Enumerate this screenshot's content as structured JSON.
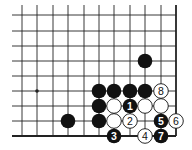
{
  "diagram": {
    "type": "go-problem",
    "grid": {
      "columns_x": [
        22,
        37,
        53,
        68,
        84,
        99,
        114,
        130,
        145,
        161,
        176
      ],
      "rows_y": [
        15,
        31,
        46,
        61,
        76,
        91,
        106,
        121,
        136
      ],
      "left_extent": 12,
      "top_extent": 5,
      "right_edge": true,
      "bottom_edge": true
    },
    "star_points": [
      {
        "col": 1,
        "row": 5
      }
    ],
    "stones": [
      {
        "col": 8,
        "row": 3,
        "color": "black",
        "label": ""
      },
      {
        "col": 5,
        "row": 5,
        "color": "black",
        "label": ""
      },
      {
        "col": 6,
        "row": 5,
        "color": "black",
        "label": ""
      },
      {
        "col": 7,
        "row": 5,
        "color": "black",
        "label": ""
      },
      {
        "col": 8,
        "row": 5,
        "color": "black",
        "label": ""
      },
      {
        "col": 9,
        "row": 5,
        "color": "white",
        "label": "8"
      },
      {
        "col": 5,
        "row": 6,
        "color": "black",
        "label": ""
      },
      {
        "col": 6,
        "row": 6,
        "color": "white",
        "label": ""
      },
      {
        "col": 7,
        "row": 6,
        "color": "black",
        "label": "1"
      },
      {
        "col": 8,
        "row": 6,
        "color": "white",
        "label": ""
      },
      {
        "col": 9,
        "row": 6,
        "color": "white",
        "label": ""
      },
      {
        "col": 3,
        "row": 7,
        "color": "black",
        "label": ""
      },
      {
        "col": 5,
        "row": 7,
        "color": "black",
        "label": ""
      },
      {
        "col": 6,
        "row": 7,
        "color": "white",
        "label": ""
      },
      {
        "col": 7,
        "row": 7,
        "color": "white",
        "label": "2"
      },
      {
        "col": 9,
        "row": 7,
        "color": "black",
        "label": "5"
      },
      {
        "col": 10,
        "row": 7,
        "color": "white",
        "label": "6"
      },
      {
        "col": 6,
        "row": 8,
        "color": "black",
        "label": "3"
      },
      {
        "col": 8,
        "row": 8,
        "color": "white",
        "label": "4"
      },
      {
        "col": 9,
        "row": 8,
        "color": "black",
        "label": "7"
      }
    ],
    "colors": {
      "line": "#222222",
      "black_stone": "#111111",
      "white_stone": "#ffffff",
      "background": "#ffffff"
    }
  }
}
